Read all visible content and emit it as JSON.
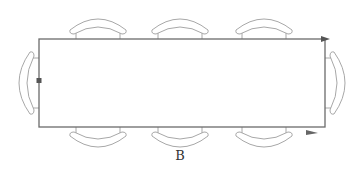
{
  "diagram": {
    "type": "table seating layout",
    "label": "B",
    "table": {
      "x": 39,
      "y": 39,
      "width": 286,
      "height": 88
    },
    "chairs": {
      "top_count": 3,
      "bottom_count": 3,
      "left_count": 1,
      "right_count": 1
    },
    "markers": [
      "left-edge square marker",
      "top-right arrow",
      "bottom-right arrow"
    ],
    "colors": {
      "line": "#6b6b6b",
      "chair": "#a8a8a8",
      "background": "#ffffff"
    }
  }
}
